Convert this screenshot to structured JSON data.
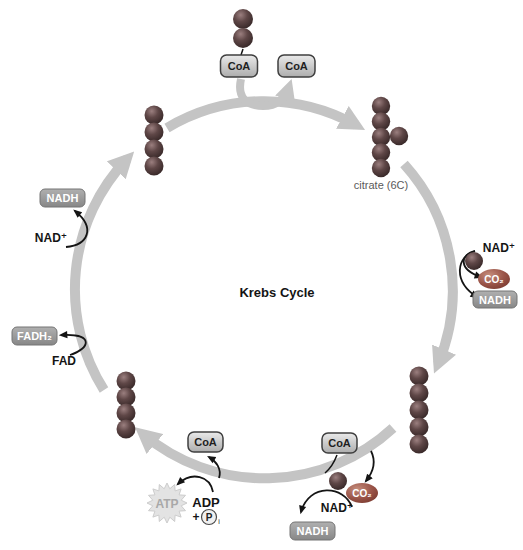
{
  "figure": {
    "title": "Krebs Cycle",
    "labels": {
      "coa": "CoA",
      "nadh": "NADH",
      "nad_plus": "NAD⁺",
      "fadh2": "FADH₂",
      "fad": "FAD",
      "co2": "CO₂",
      "atp": "ATP",
      "adp": "ADP",
      "plus_sign": "+",
      "phosphate": "P",
      "phosphate_sub": "i",
      "citrate": "citrate (6C)"
    },
    "molecule_chains": {
      "acetyl_top": {
        "carbons": 2
      },
      "citrate_top_right": {
        "carbons": 6
      },
      "chain_bottom_right": {
        "carbons": 5
      },
      "chain_bottom_left": {
        "carbons": 4
      },
      "chain_top_left": {
        "carbons": 4
      }
    },
    "colors": {
      "background": "#ffffff",
      "cycle_arrow": "#c4c4c4",
      "carbon_ball_dark": "#3f2e2e",
      "carbon_ball_light": "#9b7f7f",
      "co2_oval": "#9a5448",
      "coa_box_fill": "#d8d8d8",
      "coa_box_border": "#3f3f3f",
      "product_box_fill": "#929292",
      "product_box_border": "#757575",
      "product_box_text": "#ffffff",
      "atp_burst_fill": "#e3e3e3",
      "atp_text": "#a8a8a8",
      "black_arrow": "#141414",
      "citrate_label": "#5a5a5a"
    }
  }
}
